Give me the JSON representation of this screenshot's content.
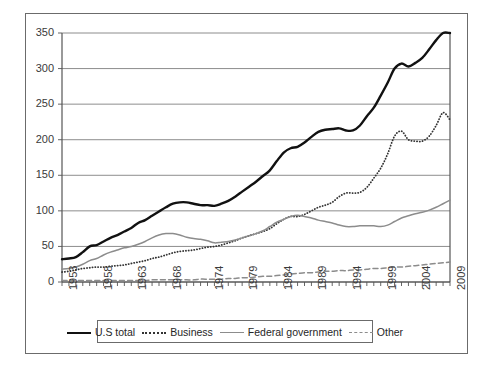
{
  "chart_data": {
    "type": "line",
    "title": "",
    "subtitle": "",
    "xlabel": "",
    "ylabel": "",
    "xlim": [
      1953,
      2009
    ],
    "ylim": [
      0,
      350
    ],
    "yticks": [
      0,
      50,
      100,
      150,
      200,
      250,
      300,
      350
    ],
    "xticks": [
      1953,
      1958,
      1963,
      1968,
      1974,
      1979,
      1984,
      1989,
      1994,
      1999,
      2004,
      2009
    ],
    "x_tick_labels": [
      "1953",
      "1958",
      "1963",
      "1968",
      "1974",
      "1979",
      "1984",
      "1989",
      "1994",
      "1999",
      "2004",
      "2009"
    ],
    "y_tick_labels": [
      "0",
      "50",
      "100",
      "150",
      "200",
      "250",
      "300",
      "350"
    ],
    "grid": "horizontal",
    "legend_position": "bottom",
    "x": [
      1953,
      1954,
      1955,
      1956,
      1957,
      1958,
      1959,
      1960,
      1961,
      1962,
      1963,
      1964,
      1965,
      1966,
      1967,
      1968,
      1969,
      1970,
      1971,
      1972,
      1973,
      1974,
      1975,
      1976,
      1977,
      1978,
      1979,
      1980,
      1981,
      1982,
      1983,
      1984,
      1985,
      1986,
      1987,
      1988,
      1989,
      1990,
      1991,
      1992,
      1993,
      1994,
      1995,
      1996,
      1997,
      1998,
      1999,
      2000,
      2001,
      2002,
      2003,
      2004,
      2005,
      2006,
      2007,
      2008,
      2009
    ],
    "series": [
      {
        "name": "U.S total",
        "style": "solid",
        "color": "#111111",
        "width": 2.4,
        "values": [
          32,
          33,
          35,
          42,
          50,
          52,
          57,
          62,
          66,
          71,
          76,
          83,
          87,
          93,
          99,
          105,
          110,
          112,
          112,
          110,
          108,
          108,
          107,
          110,
          114,
          120,
          127,
          134,
          141,
          149,
          157,
          170,
          182,
          188,
          190,
          196,
          204,
          211,
          214,
          215,
          216,
          213,
          213,
          220,
          233,
          245,
          262,
          280,
          300,
          307,
          303,
          308,
          315,
          327,
          340,
          350,
          350
        ]
      },
      {
        "name": "Business",
        "style": "dotted",
        "color": "#333333",
        "width": 1.8,
        "values": [
          14,
          15,
          17,
          19,
          20,
          21,
          21,
          22,
          23,
          24,
          26,
          28,
          30,
          33,
          35,
          38,
          41,
          43,
          44,
          45,
          47,
          49,
          50,
          52,
          55,
          58,
          62,
          65,
          68,
          71,
          75,
          82,
          88,
          92,
          92,
          95,
          100,
          105,
          108,
          112,
          120,
          125,
          125,
          126,
          133,
          146,
          160,
          180,
          205,
          212,
          200,
          198,
          198,
          205,
          220,
          238,
          228
        ]
      },
      {
        "name": "Federal government",
        "style": "solid",
        "color": "#8c8c8c",
        "width": 1.5,
        "values": [
          18,
          19,
          21,
          25,
          30,
          33,
          38,
          42,
          45,
          48,
          50,
          53,
          57,
          62,
          66,
          68,
          68,
          66,
          63,
          61,
          60,
          58,
          55,
          56,
          57,
          59,
          62,
          65,
          68,
          72,
          78,
          84,
          88,
          92,
          94,
          92,
          90,
          87,
          85,
          83,
          80,
          78,
          78,
          79,
          79,
          79,
          78,
          80,
          85,
          90,
          93,
          96,
          98,
          101,
          105,
          110,
          115
        ]
      },
      {
        "name": "Other",
        "style": "dashed",
        "color": "#8c8c8c",
        "width": 1.5,
        "values": [
          2,
          2,
          2,
          2,
          2,
          2,
          2,
          2,
          2,
          2,
          2,
          2,
          2,
          3,
          3,
          3,
          3,
          3,
          3,
          3,
          4,
          4,
          4,
          4,
          5,
          5,
          6,
          6,
          7,
          8,
          8,
          9,
          10,
          11,
          12,
          13,
          13,
          14,
          15,
          15,
          16,
          16,
          17,
          17,
          18,
          19,
          19,
          20,
          21,
          21,
          22,
          23,
          24,
          25,
          26,
          27,
          28
        ]
      }
    ]
  },
  "legend": {
    "items": [
      {
        "label": "U.S total",
        "swatch": "solid-thick-line-icon"
      },
      {
        "label": "Business",
        "swatch": "dotted-line-icon"
      },
      {
        "label": "Federal government",
        "swatch": "solid-gray-line-icon"
      },
      {
        "label": "Other",
        "swatch": "dashed-line-icon"
      }
    ]
  }
}
